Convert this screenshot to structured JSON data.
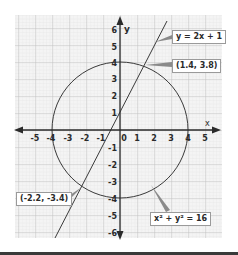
{
  "figure": {
    "x_axis_label": "x",
    "y_axis_label": "y",
    "x_ticks": [
      "-5",
      "-4",
      "-3",
      "-2",
      "-1",
      "0",
      "1",
      "2",
      "3",
      "4",
      "5"
    ],
    "y_ticks_positive": [
      "1",
      "2",
      "3",
      "4",
      "5",
      "6"
    ],
    "y_ticks_negative": [
      "-1",
      "-2",
      "-3",
      "-4",
      "-5",
      "-6"
    ],
    "line_label": "y = 2x + 1",
    "circle_label": "x² + y² = 16",
    "intersection_1": "(1.4, 3.8)",
    "intersection_2": "(-2.2, -3.4)"
  },
  "colors": {
    "grid_minor": "#dcdcdc",
    "grid_major": "#b9b9b9",
    "axis": "#2a2a2a",
    "curve": "#3a3a3a",
    "pointer": "#8a8a8a"
  }
}
